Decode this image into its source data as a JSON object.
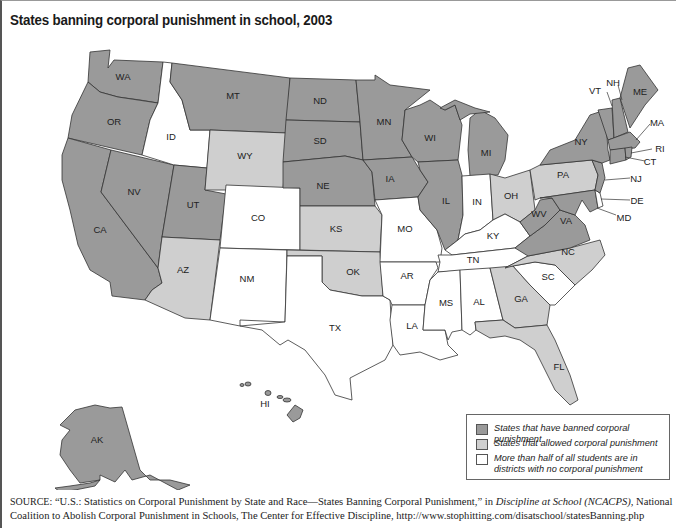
{
  "title": "States banning corporal punishment in school, 2003",
  "colors": {
    "banned": "#9a9a9a",
    "allowed": "#cfcfcf",
    "majority_no_cp": "#ffffff",
    "border": "#333333"
  },
  "legend": {
    "items": [
      {
        "key": "banned",
        "label": "States that have banned corporal punishment"
      },
      {
        "key": "allowed",
        "label": "States that allowed corporal punishment"
      },
      {
        "key": "majority_no_cp",
        "label": "More than half of all students are in districts with no corporal punishment"
      }
    ]
  },
  "source": {
    "prefix": "SOURCE:",
    "text_1": " “U.S.: Statistics on Corporal Punishment by State and Race—States Banning Corporal Punishment,” in ",
    "publication": "Discipline at School (NCACPS),",
    "text_2": " National Coalition to Abolish Corporal Punishment in Schools, The Center for Effective Discipline, http://www.stophitting.com/disatschool/statesBanning.php"
  },
  "states": {
    "WA": "banned",
    "OR": "banned",
    "CA": "banned",
    "NV": "banned",
    "UT": "banned",
    "MT": "banned",
    "ND": "banned",
    "SD": "banned",
    "NE": "banned",
    "MN": "banned",
    "IA": "banned",
    "WI": "banned",
    "IL": "banned",
    "MI": "banned",
    "NY": "banned",
    "VT": "banned",
    "NH": "banned",
    "ME": "banned",
    "MA": "banned",
    "RI": "banned",
    "CT": "banned",
    "NJ": "banned",
    "MD": "banned",
    "WV": "banned",
    "VA": "banned",
    "AK": "banned",
    "HI": "banned",
    "WY": "allowed",
    "KS": "allowed",
    "OK": "allowed",
    "AZ": "allowed",
    "OH": "allowed",
    "PA": "allowed",
    "NC": "allowed",
    "GA": "allowed",
    "FL": "allowed",
    "ID": "majority_no_cp",
    "CO": "majority_no_cp",
    "NM": "majority_no_cp",
    "TX": "majority_no_cp",
    "MO": "majority_no_cp",
    "AR": "majority_no_cp",
    "LA": "majority_no_cp",
    "MS": "majority_no_cp",
    "AL": "majority_no_cp",
    "TN": "majority_no_cp",
    "KY": "majority_no_cp",
    "IN": "majority_no_cp",
    "SC": "majority_no_cp",
    "DE": "majority_no_cp"
  },
  "labels": {
    "WA": "WA",
    "OR": "OR",
    "CA": "CA",
    "NV": "NV",
    "ID": "ID",
    "UT": "UT",
    "AZ": "AZ",
    "MT": "MT",
    "WY": "WY",
    "CO": "CO",
    "NM": "NM",
    "ND": "ND",
    "SD": "SD",
    "NE": "NE",
    "KS": "KS",
    "OK": "OK",
    "TX": "TX",
    "MN": "MN",
    "IA": "IA",
    "MO": "MO",
    "AR": "AR",
    "LA": "LA",
    "WI": "WI",
    "IL": "IL",
    "MI": "MI",
    "IN": "IN",
    "OH": "OH",
    "KY": "KY",
    "TN": "TN",
    "MS": "MS",
    "AL": "AL",
    "GA": "GA",
    "FL": "FL",
    "SC": "SC",
    "NC": "NC",
    "VA": "VA",
    "WV": "WV",
    "PA": "PA",
    "NY": "NY",
    "VT": "VT",
    "NH": "NH",
    "ME": "ME",
    "MA": "MA",
    "RI": "RI",
    "CT": "CT",
    "NJ": "NJ",
    "DE": "DE",
    "MD": "MD",
    "AK": "AK",
    "HI": "HI"
  }
}
